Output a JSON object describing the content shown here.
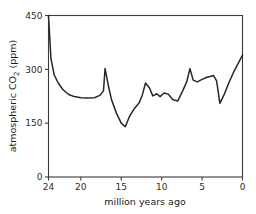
{
  "chart_data": {
    "type": "line",
    "title": "",
    "xlabel": "million years ago",
    "ylabel": "atmospheric CO2 (ppm)",
    "ylabel_display": "atmospheric CO",
    "ylabel_sub": "2",
    "ylabel_units": " (ppm)",
    "xlim": [
      24,
      0
    ],
    "ylim": [
      0,
      450
    ],
    "x_reversed": true,
    "grid": false,
    "legend": null,
    "xticks": [
      24,
      20,
      15,
      10,
      5,
      0
    ],
    "xtick_labels": [
      "24",
      "20",
      "15",
      "10",
      "5",
      "0"
    ],
    "yticks": [
      0,
      150,
      300,
      450
    ],
    "ytick_labels": [
      "0",
      "150",
      "300",
      "450"
    ],
    "series": [
      {
        "name": "atmospheric CO2",
        "color": "#262626",
        "x": [
          24.0,
          23.7,
          23.3,
          22.8,
          22.2,
          21.5,
          20.8,
          20.0,
          19.2,
          18.3,
          17.6,
          17.2,
          17.0,
          16.6,
          16.2,
          15.6,
          15.0,
          14.5,
          14.0,
          13.4,
          12.8,
          12.4,
          12.0,
          11.5,
          11.1,
          10.6,
          10.2,
          9.7,
          9.2,
          8.6,
          8.0,
          7.4,
          6.9,
          6.5,
          6.1,
          5.6,
          5.0,
          4.4,
          4.0,
          3.6,
          3.2,
          2.8,
          2.3,
          1.7,
          1.1,
          0.5,
          0.0
        ],
        "y": [
          450,
          330,
          285,
          262,
          243,
          230,
          224,
          221,
          220,
          221,
          228,
          240,
          302,
          255,
          215,
          178,
          150,
          140,
          168,
          190,
          206,
          228,
          262,
          248,
          226,
          232,
          224,
          234,
          231,
          215,
          212,
          240,
          265,
          302,
          270,
          265,
          272,
          278,
          280,
          283,
          268,
          205,
          228,
          262,
          292,
          318,
          340
        ]
      }
    ]
  },
  "axes": {
    "x_tick_count": 6,
    "y_tick_count": 4
  }
}
